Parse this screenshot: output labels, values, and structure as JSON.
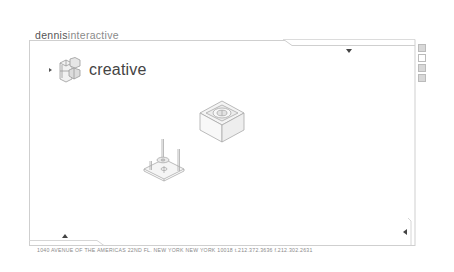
{
  "header": {
    "brand_part1": "dennis",
    "brand_part2": "interactive"
  },
  "section": {
    "label": "creative",
    "icon": "isometric-cube-logo-icon"
  },
  "navigation": {
    "down_arrow": "triangle-down-icon",
    "up_arrow": "triangle-up-icon",
    "left_arrow": "triangle-left-icon",
    "section_arrow": "triangle-right-icon"
  },
  "side_icons": [
    {
      "name": "side-square-1",
      "filled": true
    },
    {
      "name": "side-square-2",
      "filled": false
    },
    {
      "name": "side-square-3",
      "filled": true
    },
    {
      "name": "side-square-4",
      "filled": true
    }
  ],
  "products": [
    {
      "name": "isometric-box-product",
      "description": "square box with circular top"
    },
    {
      "name": "isometric-plate-with-pins",
      "description": "square plate with pins and washer"
    }
  ],
  "footer": {
    "address": "1040 AVENUE OF THE AMERICAS 22ND FL.  NEW YORK NEW YORK 10018  t.212.372.3636  f.212.302.2631"
  },
  "colors": {
    "frame_line": "#c8c8c8",
    "text_dark": "#444444",
    "text_light": "#8a8a8a",
    "background": "#ffffff"
  }
}
